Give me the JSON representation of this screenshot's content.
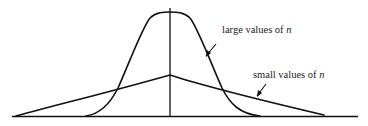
{
  "diagram": {
    "type": "distribution-comparison",
    "labels": {
      "large": {
        "text": "large values of ",
        "var": "n"
      },
      "small": {
        "text": "small values of ",
        "var": "n"
      }
    },
    "curves": [
      {
        "name": "large values of n",
        "shape": "tall narrow bell curve",
        "peak": [
          170,
          14
        ]
      },
      {
        "name": "small values of n",
        "shape": "flat wide peaked curve",
        "peak": [
          170,
          75
        ]
      }
    ],
    "colors": {
      "ink": "#111111",
      "background": "#ffffff"
    }
  }
}
